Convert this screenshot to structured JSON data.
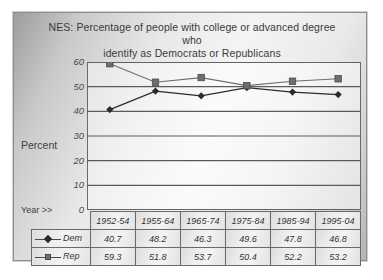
{
  "chart_data": {
    "type": "line",
    "title": "NES:  Percentage of people with college or advanced degree who identify as Democrats or Republicans",
    "title_line1": "NES:  Percentage of people with college or advanced degree who",
    "title_line2": "identify as Democrats or Republicans",
    "xlabel": "Year >>",
    "ylabel": "Percent",
    "categories": [
      "1952-54",
      "1955-64",
      "1965-74",
      "1975-84",
      "1985-94",
      "1995-04"
    ],
    "series": [
      {
        "name": "Dem",
        "marker": "diamond",
        "color": "#2b2b2b",
        "values": [
          40.7,
          48.2,
          46.3,
          49.6,
          47.8,
          46.8
        ]
      },
      {
        "name": "Rep",
        "marker": "square",
        "color": "#6e6e6e",
        "values": [
          59.3,
          51.8,
          53.7,
          50.4,
          52.2,
          53.2
        ]
      }
    ],
    "ylim": [
      0,
      60
    ],
    "yticks": [
      "60",
      "50",
      "40",
      "30",
      "20",
      "10",
      "0"
    ],
    "grid": "horizontal",
    "legend_position": "data-table-left"
  },
  "table": {
    "header_row": [
      "",
      "1952-54",
      "1955-64",
      "1965-74",
      "1975-84",
      "1985-94",
      "1995-04"
    ],
    "rows": [
      {
        "label": "Dem",
        "values": [
          "40.7",
          "48.2",
          "46.3",
          "49.6",
          "47.8",
          "46.8"
        ]
      },
      {
        "label": "Rep",
        "values": [
          "59.3",
          "51.8",
          "53.7",
          "50.4",
          "52.2",
          "53.2"
        ]
      }
    ]
  }
}
